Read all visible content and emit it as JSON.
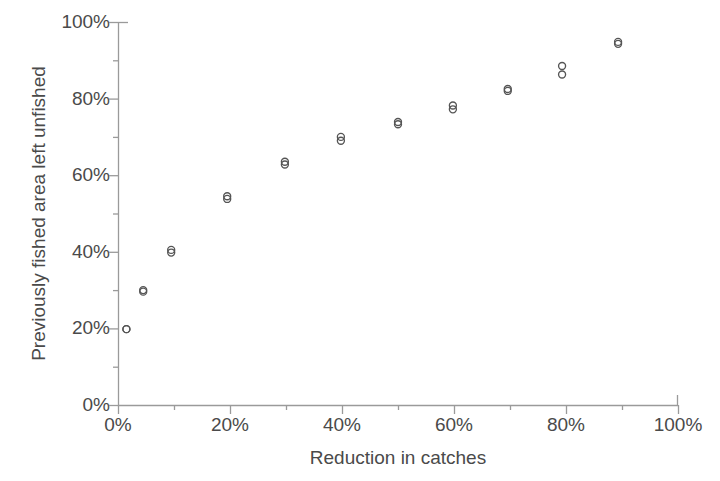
{
  "chart_data": {
    "type": "scatter",
    "title": "",
    "xlabel": "Reduction in catches",
    "ylabel": "Previously fished area left unfished",
    "xlim": [
      0,
      100
    ],
    "ylim": [
      0,
      100
    ],
    "grid": false,
    "legend": "none",
    "x_tick_labels": [
      "0%",
      "20%",
      "40%",
      "60%",
      "80%",
      "100%"
    ],
    "x_tick_values": [
      0,
      20,
      40,
      60,
      80,
      100
    ],
    "x_minor_tick_values": [
      10,
      30,
      50,
      70,
      90
    ],
    "y_tick_labels": [
      "0%",
      "20%",
      "40%",
      "60%",
      "80%",
      "100%"
    ],
    "y_tick_values": [
      0,
      20,
      40,
      60,
      80,
      100
    ],
    "y_minor_tick_values": [
      10,
      30,
      50,
      70,
      90
    ],
    "marker": "open-circle",
    "marker_color": "#555555",
    "marker_size": 7,
    "series": [
      {
        "name": "series-1",
        "x": [
          1.5,
          4.5,
          9.5,
          19.5,
          29.8,
          39.8,
          50.0,
          59.8,
          69.6,
          79.3,
          89.3
        ],
        "y": [
          19.8,
          30.0,
          40.5,
          54.5,
          63.5,
          70.0,
          73.9,
          78.2,
          82.5,
          88.5,
          94.8
        ]
      },
      {
        "name": "series-2",
        "x": [
          1.5,
          4.5,
          9.5,
          19.5,
          29.8,
          39.8,
          50.0,
          59.8,
          69.6,
          79.3,
          89.3
        ],
        "y": [
          19.8,
          29.6,
          39.8,
          53.8,
          62.8,
          69.0,
          73.3,
          77.2,
          82.0,
          86.3,
          94.3
        ]
      }
    ]
  },
  "axis": {
    "line_color": "#9a9a9a",
    "tick_length_major": 9,
    "tick_length_minor": 5
  }
}
